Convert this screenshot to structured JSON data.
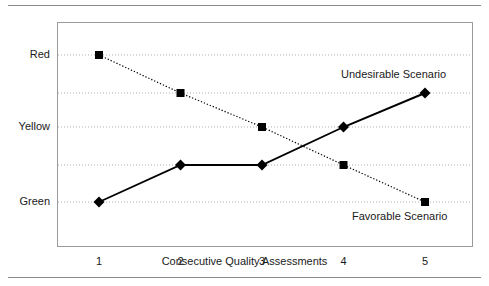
{
  "figure": {
    "background": "#ffffff",
    "frame_color": "#9a9a9a",
    "rule_color": "#8a8a8a",
    "ink_color": "#000000",
    "grid_color": "#b0b0b0"
  },
  "chart_data": {
    "type": "line",
    "title": "",
    "subtitle": "",
    "xlabel": "Consecutive Quality Assessments",
    "ylabel": "",
    "x": [
      1,
      2,
      3,
      4,
      5
    ],
    "categories": [
      "1",
      "2",
      "3",
      "4",
      "5"
    ],
    "xtick_labels": [
      "1",
      "2",
      "3",
      "4",
      "5"
    ],
    "ytick_labels": [
      "Green",
      "",
      "Yellow",
      "",
      "Red"
    ],
    "ytick_values": [
      1,
      2,
      3,
      4,
      5
    ],
    "ylim": [
      0.5,
      5.5
    ],
    "xlim": [
      0.5,
      5.5
    ],
    "grid": true,
    "grid_axis": "y",
    "grid_style": "dotted",
    "legend_position": "inline-annotation",
    "series": [
      {
        "name": "Favorable Scenario",
        "values": [
          5,
          4,
          3,
          2,
          1
        ],
        "value_labels": [
          "Red",
          "",
          "Yellow",
          "",
          "Green"
        ],
        "marker": "square",
        "line_style": "dotted",
        "color": "#000000",
        "annotation": "Favorable Scenario"
      },
      {
        "name": "Undesirable Scenario",
        "values": [
          1,
          2,
          2,
          3,
          4
        ],
        "value_labels": [
          "Green",
          "",
          "",
          "Yellow",
          ""
        ],
        "marker": "diamond",
        "line_style": "solid",
        "color": "#000000",
        "annotation": "Undesirable Scenario"
      }
    ],
    "annotations": [
      {
        "text": "Undesirable Scenario",
        "x": 4.6,
        "y": 4.6
      },
      {
        "text": "Favorable Scenario",
        "x": 4.7,
        "y": 0.75
      }
    ]
  }
}
